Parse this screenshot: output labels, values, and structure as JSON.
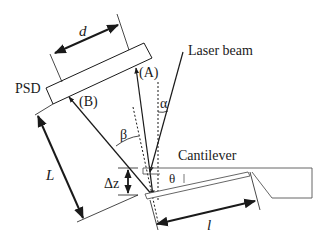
{
  "diagram": {
    "labels": {
      "psd": "PSD",
      "laser_beam": "Laser beam",
      "cantilever": "Cantilever",
      "point_a": "(A)",
      "point_b": "(B)",
      "alpha": "α",
      "beta": "β",
      "theta": "θ",
      "d": "d",
      "L": "L",
      "delta_z": "Δz",
      "l": "l"
    },
    "colors": {
      "line": "#1a1a1a",
      "thin_line": "#555555",
      "background": "#ffffff"
    }
  }
}
